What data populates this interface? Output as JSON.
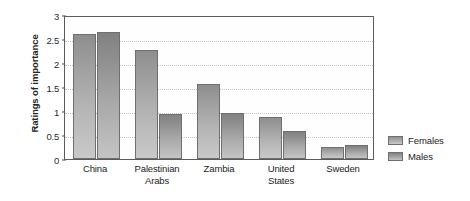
{
  "chart_data": {
    "type": "bar",
    "title": "",
    "xlabel": "",
    "ylabel": "Ratings of importance",
    "ylim": [
      0,
      3
    ],
    "yticks": [
      "0",
      "0.5",
      "1",
      "1.5",
      "2",
      "2.5",
      "3"
    ],
    "ytick_values": [
      0,
      0.5,
      1,
      1.5,
      2,
      2.5,
      3
    ],
    "grid": true,
    "legend_position": "right",
    "categories": [
      "China",
      "Palestinian Arabs",
      "Zambia",
      "United States",
      "Sweden"
    ],
    "category_lines": [
      [
        "China"
      ],
      [
        "Palestinian",
        "Arabs"
      ],
      [
        "Zambia"
      ],
      [
        "United",
        "States"
      ],
      [
        "Sweden"
      ]
    ],
    "series": [
      {
        "name": "Females",
        "color": "#a8a8a8",
        "values": [
          2.6,
          2.28,
          1.56,
          0.87,
          0.25
        ]
      },
      {
        "name": "Males",
        "color": "#9c9c9c",
        "values": [
          2.65,
          0.94,
          0.96,
          0.58,
          0.3
        ]
      }
    ]
  },
  "legend": {
    "items": [
      {
        "label": "Females",
        "swatch": "females-swatch"
      },
      {
        "label": "Males",
        "swatch": "males-swatch"
      }
    ]
  },
  "axis": {
    "y_title": "Ratings of importance"
  }
}
